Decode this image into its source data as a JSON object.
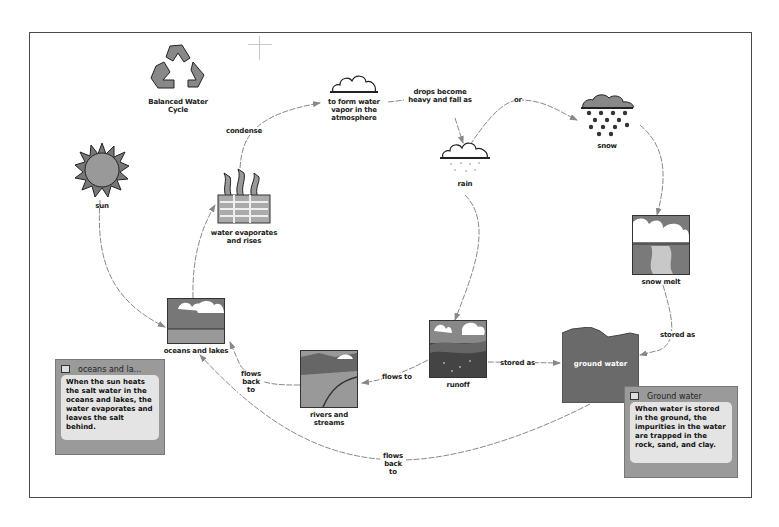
{
  "diagram": {
    "title_node": {
      "label": "Balanced Water Cycle",
      "icon": "recycle-icon"
    },
    "nodes": {
      "sun": {
        "label": "sun",
        "icon": "sun-icon"
      },
      "water_vapor": {
        "label": "to form water vapor in the atmosphere",
        "icon": "cloud-icon"
      },
      "evaporates": {
        "label": "water evaporates and rises",
        "icon": "evaporation-icon"
      },
      "rain": {
        "label": "rain",
        "icon": "rain-cloud-icon"
      },
      "snow": {
        "label": "snow",
        "icon": "snow-cloud-icon"
      },
      "snow_melt": {
        "label": "snow melt",
        "icon": "snow-melt-icon"
      },
      "oceans": {
        "label": "oceans and lakes",
        "icon": "ocean-icon"
      },
      "rivers": {
        "label": "rivers and streams",
        "icon": "river-icon"
      },
      "runoff": {
        "label": "runoff",
        "icon": "runoff-icon"
      },
      "ground_water": {
        "label": "ground water",
        "icon": "ground-water-shape"
      }
    },
    "links": {
      "condense": "condense",
      "drops_heavy": "drops become heavy and fall as",
      "or": "or",
      "stored_as_runoff": "stored as",
      "stored_as_snowmelt": "stored as",
      "flows_to": "flows to",
      "flows_back_to_rivers": "flows back to",
      "flows_back_to_ground": "flows back to"
    },
    "notes": [
      {
        "title": "oceans and la...",
        "body": "When the sun heats the salt water in the oceans and lakes, the water evaporates and leaves the salt behind."
      },
      {
        "title": "Ground water",
        "body": "When water is stored in the ground, the impurities in the water are trapped in the rock, sand, and clay."
      }
    ]
  },
  "colors": {
    "frame": "#4a4a4a",
    "link": "#8a8a8a",
    "note_bg": "#9a9a9a",
    "note_body": "#e4e4e4",
    "ground_water": "#6a6a6a"
  }
}
